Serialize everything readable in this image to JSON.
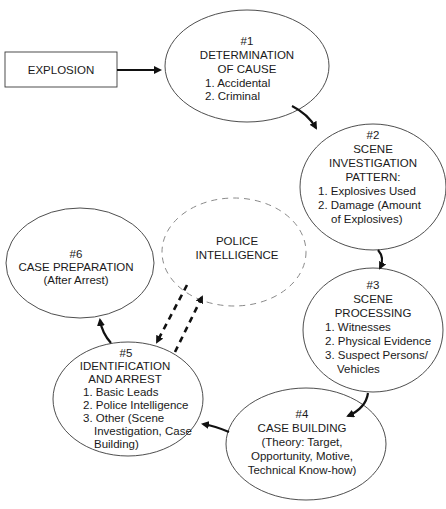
{
  "diagram": {
    "start": {
      "label": "EXPLOSION"
    },
    "nodes": [
      {
        "id": "n1",
        "number": "#1",
        "title": [
          "DETERMINATION",
          "OF CAUSE"
        ],
        "items": [
          "1. Accidental",
          "2. Criminal"
        ]
      },
      {
        "id": "n2",
        "number": "#2",
        "title": [
          "SCENE",
          "INVESTIGATION",
          "PATTERN:"
        ],
        "items": [
          "1. Explosives Used",
          "2. Damage (Amount",
          "of Explosives)"
        ]
      },
      {
        "id": "n3",
        "number": "#3",
        "title": [
          "SCENE",
          "PROCESSING"
        ],
        "items": [
          "1. Witnesses",
          "2. Physical Evidence",
          "3. Suspect Persons/",
          "Vehicles"
        ]
      },
      {
        "id": "n4",
        "number": "#4",
        "title": [
          "CASE BUILDING"
        ],
        "items": [
          "(Theory: Target,",
          "Opportunity, Motive,",
          "Technical Know-how)"
        ]
      },
      {
        "id": "n5",
        "number": "#5",
        "title": [
          "IDENTIFICATION",
          "AND ARREST"
        ],
        "items": [
          "1. Basic Leads",
          "2. Police Intelligence",
          "3. Other (Scene",
          "Investigation, Case",
          "Building)"
        ]
      },
      {
        "id": "n6",
        "number": "#6",
        "title": [
          "CASE PREPARATION"
        ],
        "items": [
          "(After Arrest)"
        ]
      }
    ],
    "side_node": {
      "title": [
        "POLICE",
        "INTELLIGENCE"
      ],
      "style": "dashed"
    },
    "edges": [
      {
        "from": "EXPLOSION",
        "to": "#1",
        "style": "solid"
      },
      {
        "from": "#1",
        "to": "#2",
        "style": "solid"
      },
      {
        "from": "#2",
        "to": "#3",
        "style": "solid"
      },
      {
        "from": "#3",
        "to": "#4",
        "style": "solid"
      },
      {
        "from": "#4",
        "to": "#5",
        "style": "solid"
      },
      {
        "from": "#5",
        "to": "#6",
        "style": "solid"
      },
      {
        "from": "POLICE INTELLIGENCE",
        "to": "#5",
        "style": "dashed"
      },
      {
        "from": "#5",
        "to": "POLICE INTELLIGENCE",
        "style": "dashed"
      }
    ]
  }
}
